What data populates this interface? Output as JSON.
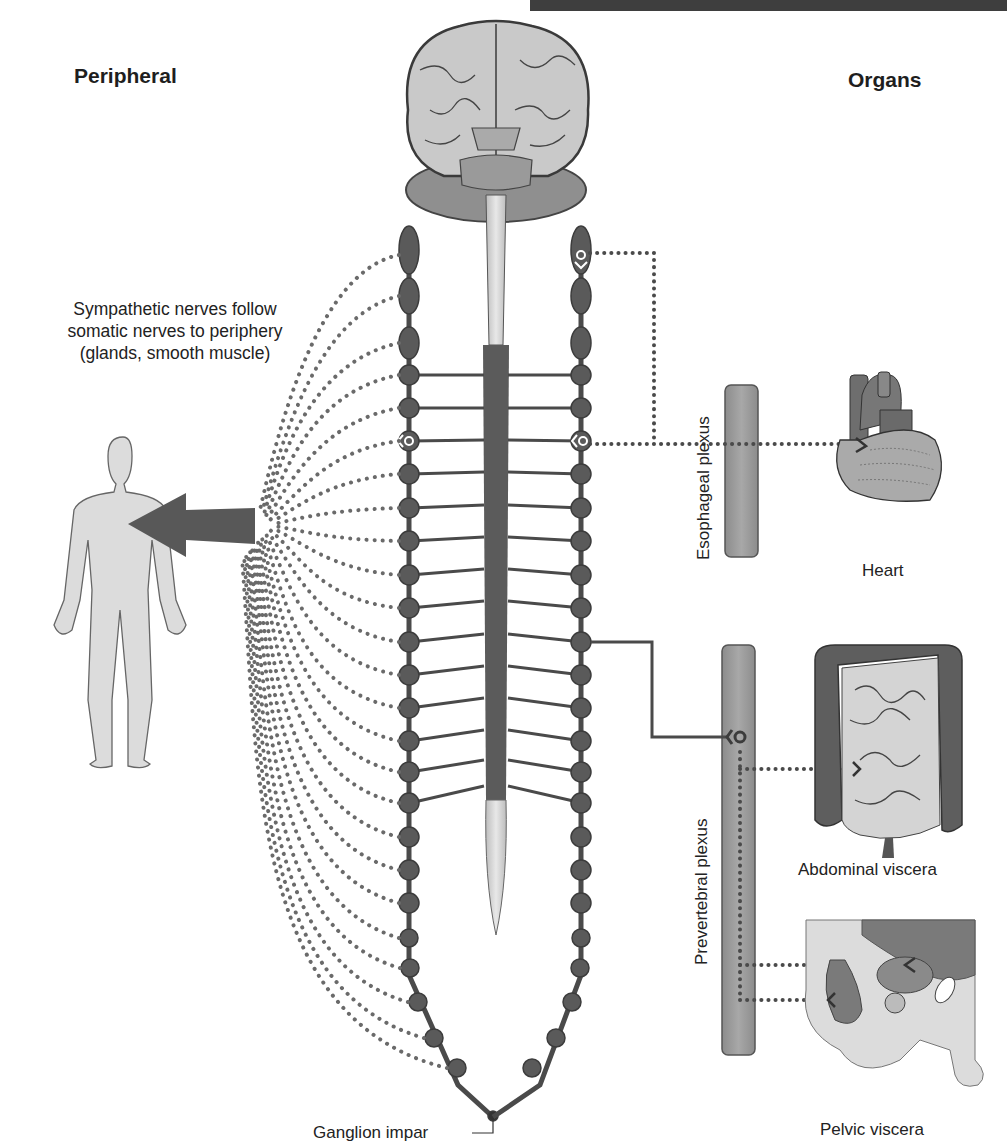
{
  "headings": {
    "left": "Peripheral",
    "right": "Organs"
  },
  "caption": {
    "line1": "Sympathetic nerves follow",
    "line2": "somatic nerves to periphery",
    "line3": "(glands, smooth muscle)"
  },
  "plexus": {
    "esophageal": "Esophageal plexus",
    "prevertebral": "Prevertebral plexus"
  },
  "organs": {
    "heart": "Heart",
    "abdominal": "Abdominal viscera",
    "pelvic": "Pelvic viscera"
  },
  "ganglion_label": "Ganglion impar",
  "structures": [
    "brain",
    "spinal-cord",
    "left-sympathetic-chain",
    "right-sympathetic-chain",
    "human-figure",
    "peripheral-arrow"
  ],
  "colors": {
    "nerve_dark": "#555555",
    "node": "#5a5a5a",
    "cord_light": "#d8d8d8",
    "body_fill": "#dcdcdc",
    "plexus_fill": "#999999",
    "dots": "#6a6a6a"
  }
}
